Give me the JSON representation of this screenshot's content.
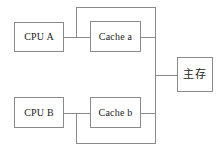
{
  "diagram": {
    "type": "block-diagram",
    "stroke_color": "#8a8a8a",
    "text_color": "#222222",
    "background_color": "#ffffff",
    "frame": {
      "label": "outer-frame",
      "x": 10,
      "y": 7,
      "width": 146,
      "height": 136
    },
    "nodes": [
      {
        "id": "cpu-a",
        "label": "CPU A",
        "x": 14,
        "y": 22,
        "width": 50,
        "height": 30,
        "script": "latin"
      },
      {
        "id": "cache-a",
        "label": "Cache a",
        "x": 90,
        "y": 21,
        "width": 51,
        "height": 31,
        "script": "latin"
      },
      {
        "id": "cpu-b",
        "label": "CPU B",
        "x": 14,
        "y": 97,
        "width": 50,
        "height": 31,
        "script": "latin"
      },
      {
        "id": "cache-b",
        "label": "Cache b",
        "x": 90,
        "y": 97,
        "width": 51,
        "height": 31,
        "script": "latin"
      },
      {
        "id": "memory",
        "label": "主存",
        "x": 177,
        "y": 57,
        "width": 36,
        "height": 35,
        "script": "cjk"
      }
    ],
    "connections": [
      {
        "id": "cpu-a-to-cache-a",
        "from": "cpu-a",
        "to": "cache-a",
        "orientation": "horizontal",
        "y": 37
      },
      {
        "id": "cpu-b-to-cache-b",
        "from": "cpu-b",
        "to": "cache-b",
        "orientation": "horizontal",
        "y": 113
      },
      {
        "id": "cache-a-to-bus",
        "from": "cache-a",
        "to": "bus",
        "orientation": "horizontal",
        "y": 37
      },
      {
        "id": "cache-b-to-bus",
        "from": "cache-b",
        "to": "bus",
        "orientation": "horizontal",
        "y": 113
      },
      {
        "id": "bus-to-memory",
        "from": "bus",
        "to": "memory",
        "orientation": "horizontal",
        "y": 75
      },
      {
        "id": "bus-vertical",
        "from": "top-loop",
        "to": "bottom-loop",
        "orientation": "vertical",
        "x": 155
      },
      {
        "id": "top-snoop-loop",
        "from": "cpu-a-cache-a-link",
        "to": "bus",
        "orientation": "path",
        "y": 7,
        "x": 76
      },
      {
        "id": "bottom-snoop-loop",
        "from": "cpu-b-cache-b-link",
        "to": "bus",
        "orientation": "path",
        "y": 143,
        "x": 76
      }
    ]
  }
}
